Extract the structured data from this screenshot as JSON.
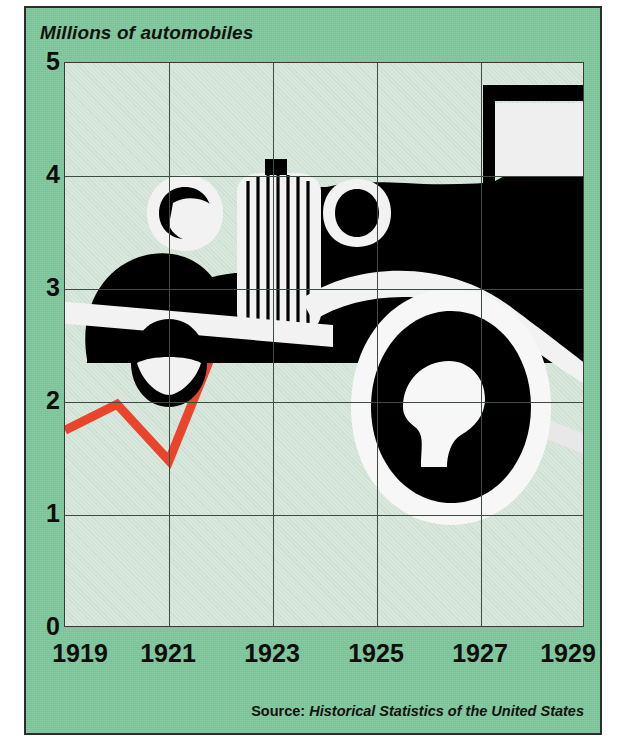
{
  "figure": {
    "y_axis_title": "Millions of automobiles",
    "source_label": "Source:",
    "source_title": "Historical Statistics of the United States",
    "illustration": "vintage-automobile-silhouette"
  },
  "colors": {
    "panel_green": "#7cc69a",
    "plot_green": "#d8e8dc",
    "line_red": "#e8452c",
    "grid": "#3f4a40",
    "ink": "#100e0c",
    "illustration": "#000000"
  },
  "chart_data": {
    "type": "line",
    "title": "",
    "subtitle": "",
    "xlabel": "",
    "ylabel": "Millions of automobiles",
    "xlim": [
      1919,
      1929
    ],
    "ylim": [
      0,
      5
    ],
    "yticks": [
      0,
      1,
      2,
      3,
      4,
      5
    ],
    "xticks": [
      1919,
      1921,
      1923,
      1925,
      1927,
      1929
    ],
    "xtick_labels": [
      "1919",
      "1921",
      "1923",
      "1925",
      "1927",
      "1929"
    ],
    "ytick_labels": [
      "0",
      "1",
      "2",
      "3",
      "4",
      "5"
    ],
    "grid": true,
    "legend": false,
    "x": [
      1919,
      1920,
      1921,
      1922,
      1923,
      1924,
      1925,
      1926,
      1927,
      1928,
      1929
    ],
    "values": [
      1.75,
      1.98,
      1.48,
      2.62,
      3.62,
      3.25,
      3.78,
      3.72,
      2.97,
      3.78,
      4.55
    ],
    "series": [
      {
        "name": "Automobile production",
        "values": [
          1.75,
          1.98,
          1.48,
          2.62,
          3.62,
          3.25,
          3.78,
          3.72,
          2.97,
          3.78,
          4.55
        ]
      }
    ],
    "annotations": []
  }
}
